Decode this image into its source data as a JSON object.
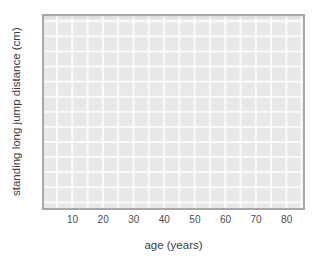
{
  "chart_data": {
    "type": "scatter",
    "title": "",
    "xlabel": "age (years)",
    "ylabel": "standing long jump distance (cm)",
    "x_ticks": [
      10,
      20,
      30,
      40,
      50,
      60,
      70,
      80
    ],
    "xlim": [
      0,
      86
    ],
    "y_ticks": [],
    "series": [],
    "grid": "on",
    "grid_minor_interval_x_years": 5,
    "legend": "none",
    "colors": {
      "panel_background": "#e8e8e8",
      "gridline": "#fbfbfb",
      "panel_border": "#a8a8a8",
      "text": "#3d3d3d",
      "tick_text": "#4e4e4e",
      "page_background": "#ffffff"
    }
  }
}
